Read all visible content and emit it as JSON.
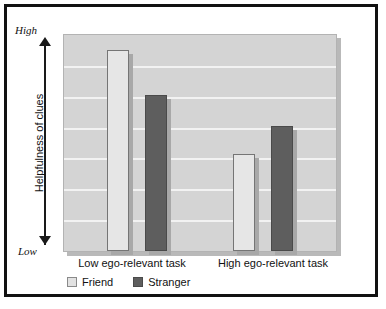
{
  "chart_data": {
    "type": "bar",
    "title": "",
    "xlabel": "",
    "ylabel": "Helpfulness of clues",
    "categories": [
      "Low ego-relevant task",
      "High ego-relevant task"
    ],
    "series": [
      {
        "name": "Friend",
        "values": [
          0.93,
          0.45
        ],
        "color": "#e6e6e6"
      },
      {
        "name": "Stranger",
        "values": [
          0.72,
          0.58
        ],
        "color": "#5e5e5e"
      }
    ],
    "ylim": [
      0,
      1
    ],
    "y_axis_low_label": "Low",
    "y_axis_high_label": "High",
    "y_tick_labels": [
      "Low",
      "High"
    ],
    "grid": true,
    "gridline_count": 6,
    "legend_position": "bottom-left",
    "legend_entries": [
      "Friend",
      "Stranger"
    ],
    "annotations": [
      "double-headed vertical axis arrow from Low to High"
    ]
  },
  "axis": {
    "high_label": "High",
    "low_label": "Low",
    "y_title": "Helpfulness of clues"
  },
  "x_labels": [
    {
      "text": "Low ego-relevant task"
    },
    {
      "text": "High ego-relevant task"
    }
  ],
  "legend": {
    "items": [
      {
        "label": "Friend",
        "color": "#e6e6e6"
      },
      {
        "label": "Stranger",
        "color": "#5e5e5e"
      }
    ]
  },
  "colors": {
    "frame": "#111111",
    "plot_background": "#d4d4d4",
    "gridline": "#f2f2f2",
    "friend_bar": "#e6e6e6",
    "stranger_bar": "#5e5e5e",
    "shadow": "#a8a8a8",
    "text": "#111111"
  }
}
